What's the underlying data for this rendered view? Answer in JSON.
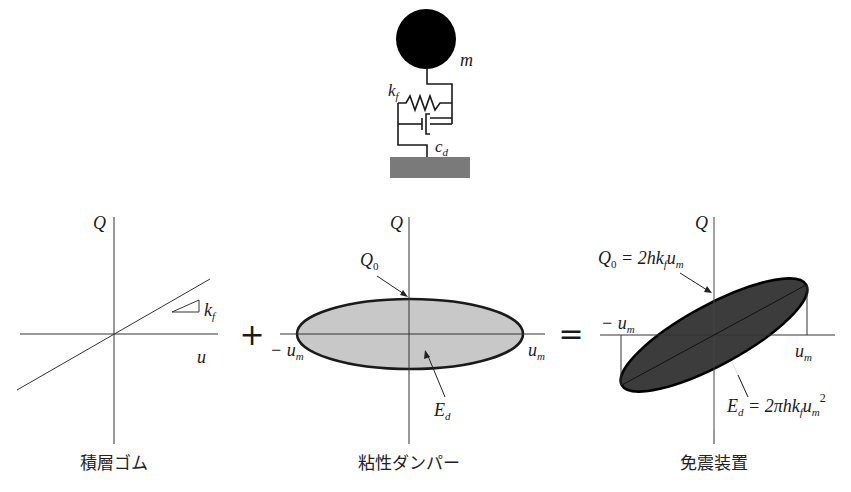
{
  "figure": {
    "model": {
      "mass_label": "m",
      "spring_label_base": "k",
      "spring_label_sub": "f",
      "damper_label_base": "c",
      "damper_label_sub": "d",
      "colors": {
        "mass": "#000000",
        "ground": "#7a7a7a"
      }
    },
    "panels": [
      {
        "id": "rubber",
        "caption": "積層ゴム",
        "y_axis_label": "Q",
        "x_axis_label": "u",
        "slope_label_base": "k",
        "slope_label_sub": "f"
      },
      {
        "id": "damper",
        "caption": "粘性ダンパー",
        "y_axis_label": "Q",
        "q0_label_base": "Q",
        "q0_label_sub": "0",
        "neg_um_prefix": "− u",
        "um_base": "u",
        "um_sub": "m",
        "ed_base": "E",
        "ed_sub": "d",
        "fill_color": "#c8c8c8"
      },
      {
        "id": "isolator",
        "caption": "免震装置",
        "y_axis_label": "Q",
        "q0_eq": {
          "lhs_base": "Q",
          "lhs_sub": "0",
          "eq": " = 2hk",
          "k_sub": "f",
          "u": "u",
          "u_sub": "m"
        },
        "neg_um_prefix": "− u",
        "um_base": "u",
        "um_sub": "m",
        "ed_eq": {
          "lhs_base": "E",
          "lhs_sub": "d",
          "eq": " = 2πhk",
          "k_sub": "f",
          "u": "u",
          "u_sub": "m",
          "sup": "2"
        },
        "fill_color": "#3c3c3c"
      }
    ],
    "operators": {
      "plus": "+",
      "equals": "="
    }
  }
}
